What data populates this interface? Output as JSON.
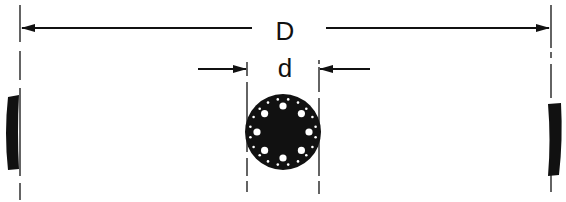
{
  "diagram": {
    "type": "dimension-drawing",
    "labels": {
      "outer_dimension": "D",
      "inner_dimension": "d"
    },
    "colors": {
      "ink": "#111111",
      "background": "#ffffff"
    },
    "elements": {
      "outer_dimension_line": {
        "y": 28,
        "x_left": 20,
        "x_right": 551,
        "label": "D"
      },
      "inner_dimension_arrows": {
        "y": 69,
        "x_left": 247,
        "x_right": 320,
        "label": "d"
      },
      "center_disc": {
        "cx": 283,
        "cy": 132,
        "r": 38,
        "large_holes": 8,
        "small_holes": 20
      },
      "left_rim_segment": {
        "x": 6,
        "y_top": 96,
        "y_bottom": 170
      },
      "right_rim_segment": {
        "x": 548,
        "y_top": 104,
        "y_bottom": 176
      }
    }
  }
}
